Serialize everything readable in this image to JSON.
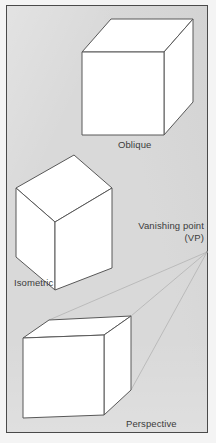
{
  "figure": {
    "background_color": "#d9d9d9",
    "border_color": "#4a4a4a",
    "cube_face_color": "#ffffff",
    "cube_line_color": "#555555",
    "construction_line_color": "#b0b0b0",
    "caption_color": "#3b3b3b"
  },
  "captions": {
    "oblique": "Oblique",
    "isometric": "Isometric",
    "perspective": "Perspective",
    "vanishing_point": "Vanishing point\n(VP)"
  },
  "diagram_data": {
    "type": "technical-illustration",
    "subject": "Three pictorial projection methods shown as cubes",
    "items": [
      {
        "name": "oblique-cube",
        "label": "Oblique",
        "description": "Square front face with top and right faces receding up-right at 45 degrees",
        "front_face": [
          [
            82,
            52
          ],
          [
            164,
            52
          ],
          [
            164,
            135
          ],
          [
            82,
            135
          ]
        ],
        "top_face": [
          [
            82,
            52
          ],
          [
            111,
            19
          ],
          [
            193,
            19
          ],
          [
            164,
            52
          ]
        ],
        "right_face": [
          [
            164,
            52
          ],
          [
            193,
            19
          ],
          [
            193,
            102
          ],
          [
            164,
            135
          ]
        ]
      },
      {
        "name": "isometric-cube",
        "label": "Isometric",
        "description": "Hexagonal silhouette with three visible rhombic faces meeting at a centre vertex",
        "top_face": [
          [
            16,
            188
          ],
          [
            74,
            155
          ],
          [
            112,
            188
          ],
          [
            55,
            222
          ]
        ],
        "left_face": [
          [
            16,
            188
          ],
          [
            55,
            222
          ],
          [
            55,
            290
          ],
          [
            16,
            257
          ]
        ],
        "right_face": [
          [
            55,
            222
          ],
          [
            112,
            188
          ],
          [
            112,
            268
          ],
          [
            55,
            290
          ]
        ],
        "centre_vertex": [
          55,
          222
        ]
      },
      {
        "name": "perspective-cube",
        "label": "Perspective",
        "description": "One-point perspective cube whose receding edges converge on the vanishing point",
        "front_face": [
          [
            23,
            338
          ],
          [
            104,
            335
          ],
          [
            104,
            415
          ],
          [
            23,
            418
          ]
        ],
        "top_face": [
          [
            23,
            338
          ],
          [
            49,
            320
          ],
          [
            131,
            316
          ],
          [
            104,
            335
          ]
        ],
        "right_face": [
          [
            104,
            335
          ],
          [
            131,
            316
          ],
          [
            131,
            390
          ],
          [
            104,
            415
          ]
        ]
      },
      {
        "name": "vanishing-point",
        "label": "Vanishing point (VP)",
        "position": [
          207,
          252
        ],
        "description": "Point at which the three faint construction lines converge"
      }
    ],
    "construction_lines": [
      {
        "from": [
          49,
          320
        ],
        "to": [
          207,
          252
        ]
      },
      {
        "from": [
          131,
          316
        ],
        "to": [
          207,
          252
        ]
      },
      {
        "from": [
          131,
          390
        ],
        "to": [
          207,
          252
        ]
      }
    ]
  }
}
